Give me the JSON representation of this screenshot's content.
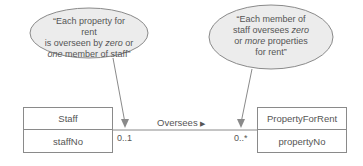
{
  "notes": [
    {
      "id": "note-left",
      "parts": [
        "“Each property for rent",
        "is overseen by ",
        "zero",
        " or",
        "one",
        " member of staff”"
      ]
    },
    {
      "id": "note-right",
      "parts": [
        "“Each member of",
        "staff oversees ",
        "zero",
        "or ",
        "more",
        " properties",
        "for rent”"
      ]
    }
  ],
  "classes": {
    "staff": {
      "name": "Staff",
      "attribute": "staffNo"
    },
    "property": {
      "name": "PropertyForRent",
      "attribute": "propertyNo"
    }
  },
  "association": {
    "label": "Oversees",
    "direction_glyph": "▶",
    "left_multiplicity": "0..1",
    "right_multiplicity": "0..*"
  },
  "colors": {
    "line": "#8a8a8a",
    "ellipse_fill": "#ececec",
    "text": "#555555"
  }
}
